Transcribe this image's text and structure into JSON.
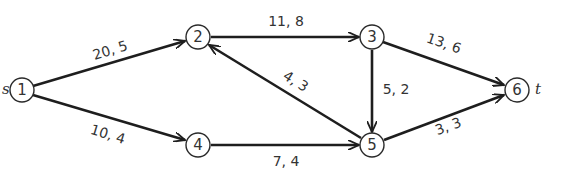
{
  "graph": {
    "nodes": [
      {
        "id": "1",
        "label": "1",
        "x": 22,
        "y": 90
      },
      {
        "id": "2",
        "label": "2",
        "x": 198,
        "y": 37
      },
      {
        "id": "3",
        "label": "3",
        "x": 372,
        "y": 37
      },
      {
        "id": "4",
        "label": "4",
        "x": 198,
        "y": 145
      },
      {
        "id": "5",
        "label": "5",
        "x": 372,
        "y": 145
      },
      {
        "id": "6",
        "label": "6",
        "x": 517,
        "y": 90
      }
    ],
    "source_label": "s",
    "sink_label": "t",
    "edges": [
      {
        "from": "1",
        "to": "2",
        "label": "20, 5"
      },
      {
        "from": "1",
        "to": "4",
        "label": "10, 4"
      },
      {
        "from": "2",
        "to": "3",
        "label": "11, 8"
      },
      {
        "from": "3",
        "to": "6",
        "label": "13, 6"
      },
      {
        "from": "3",
        "to": "5",
        "label": "5, 2"
      },
      {
        "from": "5",
        "to": "2",
        "label": "4, 3"
      },
      {
        "from": "4",
        "to": "5",
        "label": "7, 4"
      },
      {
        "from": "5",
        "to": "6",
        "label": "3, 3"
      }
    ]
  }
}
